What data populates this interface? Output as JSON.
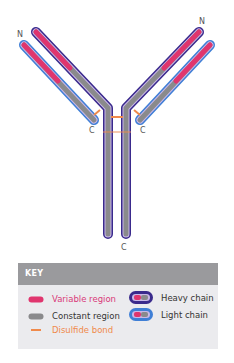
{
  "diagram": {
    "labels": {
      "n_left": "N",
      "n_right": "N",
      "c_light_left": "C",
      "c_light_right": "C",
      "c_heavy": "C"
    },
    "colors": {
      "variable": "#e0356e",
      "constant": "#8a8a8c",
      "heavy_outline": "#3a2a8c",
      "light_outline": "#3f7fd6",
      "inner_outline": "#c9b8e8",
      "disulfide": "#f08a4b"
    }
  },
  "key": {
    "header": "KEY",
    "items": [
      {
        "label": "Variable region",
        "color": "#d93a79"
      },
      {
        "label": "Constant region",
        "color": "#333333"
      },
      {
        "label": "Disulfide bond",
        "color": "#f08a4b"
      },
      {
        "label": "Heavy chain",
        "color": "#333333"
      },
      {
        "label": "Light chain",
        "color": "#333333"
      }
    ]
  }
}
